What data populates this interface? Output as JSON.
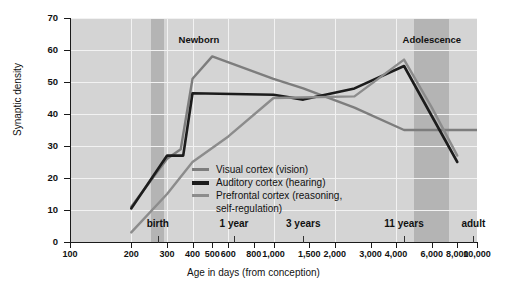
{
  "chart_data": {
    "type": "line",
    "title": "",
    "xlabel": "Age in days (from conception)",
    "ylabel": "Synaptic density",
    "xscale": "log",
    "xlim": [
      100,
      10000
    ],
    "ylim": [
      0,
      70
    ],
    "grid": true,
    "legend_position": "inside-center",
    "x_ticks": [
      100,
      200,
      300,
      400,
      500,
      600,
      800,
      1000,
      1500,
      2000,
      3000,
      4000,
      6000,
      8000,
      10000
    ],
    "x_tick_labels": [
      "100",
      "200",
      "300",
      "400",
      "500",
      "600",
      "800",
      "1,000",
      "1,500",
      "2,000",
      "3,000",
      "4,000",
      "6,000",
      "8,000",
      "10,000"
    ],
    "y_ticks": [
      0,
      10,
      20,
      30,
      40,
      50,
      60,
      70
    ],
    "y_tick_labels": [
      "0",
      "10",
      "20",
      "30",
      "40",
      "50",
      "60",
      "70"
    ],
    "milestones": [
      {
        "label": "birth",
        "x": 270
      },
      {
        "label": "1 year",
        "x": 640
      },
      {
        "label": "3 years",
        "x": 1400
      },
      {
        "label": "11 years",
        "x": 4380
      },
      {
        "label": "adult",
        "x": 9600
      }
    ],
    "bands": [
      {
        "label": "Newborn",
        "x_start": 250,
        "x_end": 290,
        "label_x": 430,
        "color": "#b4b4b4"
      },
      {
        "label": "Adolescence",
        "x_start": 4900,
        "x_end": 7300,
        "label_x": 6000,
        "color": "#b4b4b4"
      }
    ],
    "series": [
      {
        "name": "Visual cortex (vision)",
        "color": "#7d7d7d",
        "x": [
          200,
          300,
          350,
          400,
          500,
          1000,
          1400,
          2500,
          4380,
          10000
        ],
        "values": [
          11,
          26,
          29,
          51,
          58,
          51,
          48,
          42,
          35,
          35
        ]
      },
      {
        "name": "Auditory cortex (hearing)",
        "color": "#1c1c1c",
        "x": [
          200,
          300,
          360,
          400,
          1000,
          1400,
          2500,
          4380,
          8000
        ],
        "values": [
          10.5,
          27,
          27,
          46.5,
          46,
          44.5,
          48,
          55,
          25
        ]
      },
      {
        "name": "Prefrontal cortex (reasoning, self-regulation)",
        "color": "#8c8c8c",
        "x": [
          200,
          300,
          400,
          600,
          1000,
          2500,
          4380,
          6000,
          8000
        ],
        "values": [
          3,
          15,
          25,
          33,
          45,
          45.5,
          57,
          42,
          27
        ]
      }
    ],
    "legend": [
      {
        "label": "Visual cortex (vision)",
        "color": "#7d7d7d"
      },
      {
        "label": "Auditory cortex (hearing)",
        "color": "#1c1c1c"
      },
      {
        "label": "Prefrontal cortex (reasoning,",
        "continuation": "self-regulation)",
        "color": "#8c8c8c"
      }
    ]
  }
}
